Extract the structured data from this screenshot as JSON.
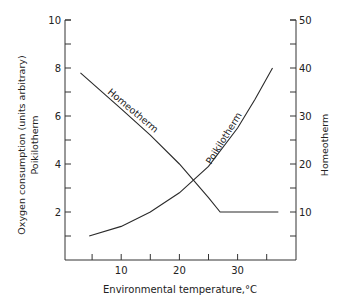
{
  "chart_data": {
    "type": "line",
    "title": "",
    "xlabel": "Environmental temperature,°C",
    "ylabel_left": "Oxygen consumption (units arbitrary)",
    "ylabel_left_sub": "Poikilotherm",
    "ylabel_right": "Homeotherm",
    "xlim": [
      0,
      40
    ],
    "ylim_left": [
      0,
      10
    ],
    "ylim_right": [
      0,
      50
    ],
    "x_ticks": [
      5,
      10,
      15,
      20,
      25,
      30,
      35
    ],
    "x_tick_labels": [
      "10",
      "20",
      "30"
    ],
    "x_tick_label_values": [
      10,
      20,
      30
    ],
    "y_left_ticks": [
      1,
      2,
      3,
      4,
      5,
      6,
      7,
      8,
      9,
      10
    ],
    "y_left_tick_labels": [
      "2",
      "4",
      "6",
      "8",
      "10"
    ],
    "y_left_tick_label_values": [
      2,
      4,
      6,
      8,
      10
    ],
    "y_right_ticks": [
      5,
      10,
      15,
      20,
      25,
      30,
      35,
      40,
      45,
      50
    ],
    "y_right_tick_labels": [
      "10",
      "20",
      "30",
      "40",
      "50"
    ],
    "y_right_tick_label_values": [
      10,
      20,
      30,
      40,
      50
    ],
    "grid": false,
    "legend": "inline labels on curves",
    "series": [
      {
        "name": "Homeotherm",
        "axis": "right",
        "label": "Homeotherm",
        "x": [
          3,
          10,
          15,
          20,
          25,
          27,
          30,
          35,
          37
        ],
        "y": [
          39,
          31.5,
          26,
          20,
          13,
          10,
          10,
          10,
          10
        ]
      },
      {
        "name": "Poikilotherm",
        "axis": "left",
        "label": "Poikilotherm",
        "x": [
          4.5,
          10,
          15,
          20,
          25,
          30,
          33,
          36
        ],
        "y": [
          1.0,
          1.4,
          2.0,
          2.8,
          3.9,
          5.5,
          6.7,
          8.0
        ]
      }
    ]
  },
  "colors": {
    "axis": "#333333",
    "line": "#2a2a2a",
    "background": "#ffffff"
  }
}
